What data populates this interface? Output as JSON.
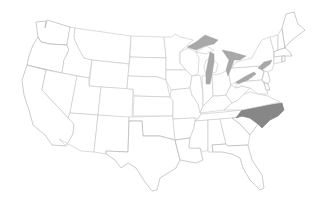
{
  "map": {
    "title": "",
    "region": "United States (contiguous)",
    "projection": "Albers-like",
    "colors": {
      "background": "#ffffff",
      "state_fill": "#ffffff",
      "state_border": "#c4c4c4",
      "highlight_fill": "#878787",
      "lake_fill": "#a8a8a8"
    },
    "highlighted_states": [
      "North Carolina"
    ],
    "water_features": [
      "Lake Superior",
      "Lake Michigan",
      "Lake Huron",
      "Lake Erie",
      "Lake Ontario"
    ],
    "states": [
      {
        "id": "WA",
        "name": "Washington"
      },
      {
        "id": "OR",
        "name": "Oregon"
      },
      {
        "id": "CA",
        "name": "California"
      },
      {
        "id": "ID",
        "name": "Idaho"
      },
      {
        "id": "NV",
        "name": "Nevada"
      },
      {
        "id": "MT",
        "name": "Montana"
      },
      {
        "id": "WY",
        "name": "Wyoming"
      },
      {
        "id": "UT",
        "name": "Utah"
      },
      {
        "id": "AZ",
        "name": "Arizona"
      },
      {
        "id": "CO",
        "name": "Colorado"
      },
      {
        "id": "NM",
        "name": "New Mexico"
      },
      {
        "id": "ND",
        "name": "North Dakota"
      },
      {
        "id": "SD",
        "name": "South Dakota"
      },
      {
        "id": "NE",
        "name": "Nebraska"
      },
      {
        "id": "KS",
        "name": "Kansas"
      },
      {
        "id": "OK",
        "name": "Oklahoma"
      },
      {
        "id": "TX",
        "name": "Texas"
      },
      {
        "id": "MN",
        "name": "Minnesota"
      },
      {
        "id": "IA",
        "name": "Iowa"
      },
      {
        "id": "MO",
        "name": "Missouri"
      },
      {
        "id": "AR",
        "name": "Arkansas"
      },
      {
        "id": "LA",
        "name": "Louisiana"
      },
      {
        "id": "WI",
        "name": "Wisconsin"
      },
      {
        "id": "IL",
        "name": "Illinois"
      },
      {
        "id": "MI",
        "name": "Michigan"
      },
      {
        "id": "IN",
        "name": "Indiana"
      },
      {
        "id": "OH",
        "name": "Ohio"
      },
      {
        "id": "KY",
        "name": "Kentucky"
      },
      {
        "id": "TN",
        "name": "Tennessee"
      },
      {
        "id": "MS",
        "name": "Mississippi"
      },
      {
        "id": "AL",
        "name": "Alabama"
      },
      {
        "id": "GA",
        "name": "Georgia"
      },
      {
        "id": "FL",
        "name": "Florida"
      },
      {
        "id": "SC",
        "name": "South Carolina"
      },
      {
        "id": "NC",
        "name": "North Carolina"
      },
      {
        "id": "VA",
        "name": "Virginia"
      },
      {
        "id": "WV",
        "name": "West Virginia"
      },
      {
        "id": "PA",
        "name": "Pennsylvania"
      },
      {
        "id": "NY",
        "name": "New York"
      },
      {
        "id": "VT",
        "name": "Vermont"
      },
      {
        "id": "NH",
        "name": "New Hampshire"
      },
      {
        "id": "ME",
        "name": "Maine"
      },
      {
        "id": "MA",
        "name": "Massachusetts"
      },
      {
        "id": "CT",
        "name": "Connecticut"
      },
      {
        "id": "RI",
        "name": "Rhode Island"
      },
      {
        "id": "NJ",
        "name": "New Jersey"
      },
      {
        "id": "DE",
        "name": "Delaware"
      },
      {
        "id": "MD",
        "name": "Maryland"
      }
    ]
  }
}
